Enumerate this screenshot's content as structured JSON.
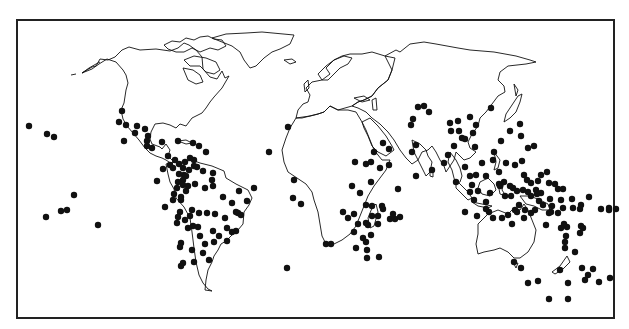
{
  "map": {
    "type": "world-dot-distribution",
    "frame_color": "#222222",
    "dot_color": "#111111",
    "dot_radius": 3.2
  },
  "chart_data": {
    "type": "scatter",
    "title": "",
    "xlabel": "",
    "ylabel": "",
    "points": [
      [
        29,
        126
      ],
      [
        47,
        134
      ],
      [
        54,
        137
      ],
      [
        122,
        111
      ],
      [
        119,
        122
      ],
      [
        126,
        125
      ],
      [
        137,
        126
      ],
      [
        145,
        129
      ],
      [
        124,
        141
      ],
      [
        135,
        133
      ],
      [
        148,
        136
      ],
      [
        147,
        141
      ],
      [
        147,
        146
      ],
      [
        152,
        148
      ],
      [
        162,
        142
      ],
      [
        178,
        141
      ],
      [
        193,
        143
      ],
      [
        199,
        146
      ],
      [
        206,
        152
      ],
      [
        168,
        156
      ],
      [
        170,
        165
      ],
      [
        175,
        160
      ],
      [
        179,
        164
      ],
      [
        185,
        162
      ],
      [
        190,
        158
      ],
      [
        194,
        160
      ],
      [
        197,
        167
      ],
      [
        203,
        171
      ],
      [
        213,
        173
      ],
      [
        163,
        169
      ],
      [
        173,
        168
      ],
      [
        183,
        168
      ],
      [
        189,
        170
      ],
      [
        194,
        166
      ],
      [
        184,
        175
      ],
      [
        186,
        176
      ],
      [
        183,
        180
      ],
      [
        178,
        182
      ],
      [
        188,
        186
      ],
      [
        183,
        185
      ],
      [
        157,
        181
      ],
      [
        179,
        174
      ],
      [
        177,
        188
      ],
      [
        195,
        184
      ],
      [
        213,
        186
      ],
      [
        223,
        197
      ],
      [
        174,
        194
      ],
      [
        181,
        197
      ],
      [
        186,
        191
      ],
      [
        205,
        188
      ],
      [
        212,
        180
      ],
      [
        180,
        212
      ],
      [
        192,
        210
      ],
      [
        181,
        200
      ],
      [
        173,
        200
      ],
      [
        165,
        207
      ],
      [
        178,
        217
      ],
      [
        177,
        223
      ],
      [
        185,
        220
      ],
      [
        190,
        216
      ],
      [
        193,
        226
      ],
      [
        199,
        213
      ],
      [
        188,
        228
      ],
      [
        181,
        243
      ],
      [
        192,
        250
      ],
      [
        200,
        236
      ],
      [
        198,
        227
      ],
      [
        205,
        244
      ],
      [
        203,
        253
      ],
      [
        214,
        242
      ],
      [
        213,
        231
      ],
      [
        215,
        214
      ],
      [
        207,
        213
      ],
      [
        219,
        236
      ],
      [
        227,
        228
      ],
      [
        236,
        231
      ],
      [
        236,
        212
      ],
      [
        239,
        191
      ],
      [
        247,
        201
      ],
      [
        254,
        188
      ],
      [
        232,
        203
      ],
      [
        238,
        213
      ],
      [
        241,
        215
      ],
      [
        225,
        218
      ],
      [
        180,
        247
      ],
      [
        183,
        263
      ],
      [
        194,
        262
      ],
      [
        209,
        260
      ],
      [
        227,
        241
      ],
      [
        232,
        232
      ],
      [
        74,
        195
      ],
      [
        61,
        211
      ],
      [
        67,
        210
      ],
      [
        46,
        217
      ],
      [
        98,
        225
      ],
      [
        181,
        266
      ],
      [
        269,
        152
      ],
      [
        288,
        127
      ],
      [
        287,
        268
      ],
      [
        293,
        198
      ],
      [
        301,
        204
      ],
      [
        294,
        180
      ],
      [
        326,
        244
      ],
      [
        331,
        244
      ],
      [
        343,
        212
      ],
      [
        348,
        218
      ],
      [
        360,
        193
      ],
      [
        354,
        214
      ],
      [
        352,
        186
      ],
      [
        355,
        162
      ],
      [
        366,
        164
      ],
      [
        371,
        182
      ],
      [
        372,
        206
      ],
      [
        368,
        225
      ],
      [
        380,
        168
      ],
      [
        374,
        152
      ],
      [
        371,
        162
      ],
      [
        383,
        143
      ],
      [
        389,
        149
      ],
      [
        389,
        165
      ],
      [
        398,
        189
      ],
      [
        412,
        152
      ],
      [
        416,
        145
      ],
      [
        413,
        119
      ],
      [
        418,
        107
      ],
      [
        411,
        125
      ],
      [
        424,
        106
      ],
      [
        429,
        112
      ],
      [
        416,
        176
      ],
      [
        358,
        224
      ],
      [
        363,
        238
      ],
      [
        366,
        242
      ],
      [
        371,
        235
      ],
      [
        378,
        216
      ],
      [
        383,
        209
      ],
      [
        378,
        224
      ],
      [
        367,
        250
      ],
      [
        367,
        258
      ],
      [
        379,
        257
      ],
      [
        390,
        219
      ],
      [
        395,
        219
      ],
      [
        400,
        217
      ],
      [
        354,
        232
      ],
      [
        356,
        248
      ],
      [
        366,
        205
      ],
      [
        366,
        223
      ],
      [
        372,
        216
      ],
      [
        382,
        206
      ],
      [
        393,
        214
      ],
      [
        432,
        170
      ],
      [
        444,
        163
      ],
      [
        448,
        155
      ],
      [
        450,
        123
      ],
      [
        451,
        131
      ],
      [
        454,
        146
      ],
      [
        459,
        131
      ],
      [
        462,
        138
      ],
      [
        458,
        121
      ],
      [
        465,
        139
      ],
      [
        470,
        117
      ],
      [
        473,
        133
      ],
      [
        476,
        125
      ],
      [
        475,
        147
      ],
      [
        486,
        176
      ],
      [
        482,
        163
      ],
      [
        493,
        160
      ],
      [
        491,
        108
      ],
      [
        494,
        152
      ],
      [
        501,
        141
      ],
      [
        510,
        131
      ],
      [
        520,
        124
      ],
      [
        522,
        161
      ],
      [
        521,
        136
      ],
      [
        528,
        148
      ],
      [
        534,
        146
      ],
      [
        456,
        182
      ],
      [
        465,
        167
      ],
      [
        470,
        176
      ],
      [
        472,
        185
      ],
      [
        470,
        192
      ],
      [
        474,
        200
      ],
      [
        490,
        193
      ],
      [
        486,
        202
      ],
      [
        499,
        184
      ],
      [
        505,
        196
      ],
      [
        511,
        196
      ],
      [
        515,
        210
      ],
      [
        519,
        205
      ],
      [
        525,
        210
      ],
      [
        531,
        213
      ],
      [
        535,
        210
      ],
      [
        539,
        201
      ],
      [
        552,
        206
      ],
      [
        558,
        213
      ],
      [
        563,
        208
      ],
      [
        531,
        183
      ],
      [
        538,
        181
      ],
      [
        547,
        172
      ],
      [
        541,
        175
      ],
      [
        549,
        183
      ],
      [
        555,
        184
      ],
      [
        558,
        189
      ],
      [
        563,
        189
      ],
      [
        536,
        190
      ],
      [
        541,
        193
      ],
      [
        550,
        199
      ],
      [
        561,
        200
      ],
      [
        572,
        199
      ],
      [
        573,
        208
      ],
      [
        580,
        209
      ],
      [
        581,
        226
      ],
      [
        580,
        233
      ],
      [
        583,
        228
      ],
      [
        601,
        209
      ],
      [
        609,
        210
      ],
      [
        616,
        209
      ],
      [
        589,
        197
      ],
      [
        581,
        205
      ],
      [
        567,
        227
      ],
      [
        566,
        236
      ],
      [
        565,
        248
      ],
      [
        575,
        252
      ],
      [
        593,
        269
      ],
      [
        588,
        275
      ],
      [
        582,
        268
      ],
      [
        568,
        283
      ],
      [
        538,
        281
      ],
      [
        521,
        268
      ],
      [
        514,
        262
      ],
      [
        565,
        242
      ],
      [
        528,
        283
      ],
      [
        549,
        299
      ],
      [
        585,
        280
      ],
      [
        560,
        270
      ],
      [
        568,
        299
      ],
      [
        599,
        282
      ],
      [
        610,
        278
      ],
      [
        609,
        208
      ],
      [
        512,
        224
      ],
      [
        478,
        191
      ],
      [
        489,
        212
      ],
      [
        500,
        186
      ],
      [
        504,
        182
      ],
      [
        524,
        175
      ],
      [
        527,
        180
      ],
      [
        506,
        163
      ],
      [
        499,
        172
      ],
      [
        515,
        165
      ],
      [
        476,
        175
      ],
      [
        465,
        212
      ],
      [
        477,
        216
      ],
      [
        486,
        209
      ],
      [
        493,
        218
      ],
      [
        502,
        218
      ],
      [
        508,
        215
      ],
      [
        517,
        212
      ],
      [
        524,
        218
      ],
      [
        551,
        212
      ],
      [
        561,
        228
      ],
      [
        564,
        224
      ],
      [
        546,
        225
      ],
      [
        549,
        213
      ],
      [
        543,
        205
      ],
      [
        537,
        194
      ],
      [
        531,
        196
      ],
      [
        528,
        192
      ],
      [
        523,
        190
      ],
      [
        517,
        191
      ],
      [
        513,
        188
      ],
      [
        510,
        186
      ]
    ]
  }
}
